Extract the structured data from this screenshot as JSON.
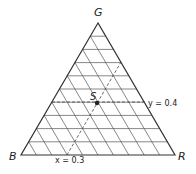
{
  "vertices": {
    "top": "G",
    "left": "B",
    "right": "R"
  },
  "point": {
    "label": "S"
  },
  "annotations": {
    "y_line": "y = 0.4",
    "x_line": "x = 0.3"
  },
  "grid": {
    "divisions": 10
  },
  "colors": {
    "line": "#333333",
    "background": "#ffffff"
  }
}
